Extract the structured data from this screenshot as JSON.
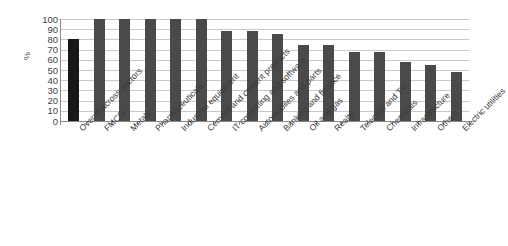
{
  "chart_data": {
    "type": "bar",
    "title": "",
    "xlabel": "",
    "ylabel": "%",
    "ylim": [
      0,
      100
    ],
    "ytick_step": 10,
    "grid": true,
    "legend": "none",
    "orientation": "vertical",
    "categories": [
      "Overall across sectors",
      "FMCG",
      "Metals",
      "Pharmaceuticals",
      "Industrial equipment",
      "Cement and cement products",
      "IT consulting and software",
      "Automobiles and parts",
      "Banking and finance",
      "Oil and gas",
      "Realty",
      "Telecom and TV",
      "Chemicals",
      "Infrastructure",
      "Others",
      "Electric utilities"
    ],
    "values": [
      80,
      100,
      100,
      100,
      100,
      100,
      88,
      88,
      85,
      75,
      75,
      68,
      68,
      58,
      55,
      48
    ],
    "ytick_labels": [
      "100",
      "90",
      "80",
      "70",
      "60",
      "50",
      "40",
      "30",
      "20",
      "10",
      "0"
    ],
    "bar_color": "#4a4a4a",
    "highlight_bar_index": 0,
    "highlight_color": "#181818",
    "gridline_color": "#c9c9c9",
    "axis_color": "#8a8a8a"
  }
}
